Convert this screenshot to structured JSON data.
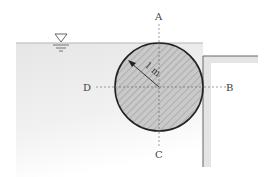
{
  "diagram": {
    "labels": {
      "top": "A",
      "right": "B",
      "bottom": "C",
      "left": "D"
    },
    "radius_label": "1 m",
    "water_surface_symbol": "free-surface-triangle",
    "colors": {
      "water": "#ececec",
      "cylinder_fill": "#c8c8c8",
      "hatch": "#9a9a9a",
      "outline": "#222222",
      "wall_fill": "#e2e2e2",
      "wall_line": "#777777",
      "axis_line": "#777777"
    }
  }
}
